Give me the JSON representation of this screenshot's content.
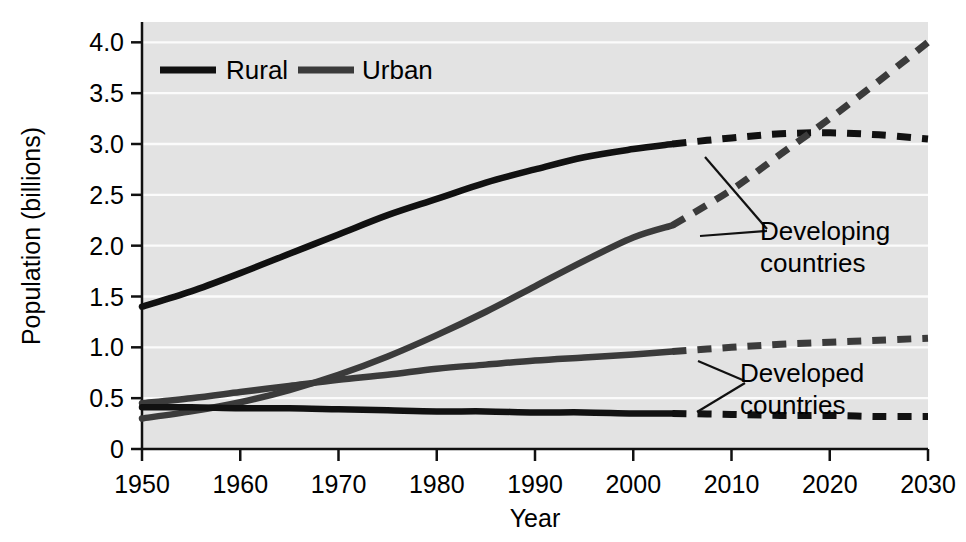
{
  "chart_data": {
    "type": "line",
    "title": "",
    "xlabel": "Year",
    "ylabel": "Population (billions)",
    "xlim": [
      1950,
      2030
    ],
    "ylim": [
      0,
      4.2
    ],
    "xticks": [
      1950,
      1960,
      1970,
      1980,
      1990,
      2000,
      2010,
      2020,
      2030
    ],
    "xtick_labels": [
      "1950",
      "1960",
      "1970",
      "1980",
      "1990",
      "2000",
      "2010",
      "2020",
      "2030"
    ],
    "yticks": [
      0,
      0.5,
      1.0,
      1.5,
      2.0,
      2.5,
      3.0,
      3.5,
      4.0
    ],
    "ytick_labels": [
      "0",
      "0.5",
      "1.0",
      "1.5",
      "2.0",
      "2.5",
      "3.0",
      "3.5",
      "4.0"
    ],
    "grid": "horizontal-white-gridlines",
    "legend_position": "top-left-inside",
    "plot_background": "#e3e3e3",
    "projection_split_year": 2004,
    "projection_style": "dashed",
    "legend": [
      {
        "name": "Rural",
        "color": "#111111"
      },
      {
        "name": "Urban",
        "color": "#3b3b3b"
      }
    ],
    "annotations": [
      {
        "text_line1": "Developing",
        "text_line2": "countries",
        "points_to": [
          "rural-developing",
          "urban-developing"
        ]
      },
      {
        "text_line1": "Developed",
        "text_line2": "countries",
        "points_to": [
          "urban-developed",
          "rural-developed"
        ]
      }
    ],
    "series": [
      {
        "name": "Rural developing",
        "group": "Developing countries",
        "type": "Rural",
        "color": "#111111",
        "x": [
          1950,
          1955,
          1960,
          1965,
          1970,
          1975,
          1980,
          1985,
          1990,
          1995,
          2000,
          2004,
          2010,
          2015,
          2020,
          2025,
          2030
        ],
        "values": [
          1.4,
          1.55,
          1.73,
          1.92,
          2.11,
          2.3,
          2.46,
          2.62,
          2.75,
          2.87,
          2.95,
          3.0,
          3.06,
          3.1,
          3.11,
          3.09,
          3.05
        ]
      },
      {
        "name": "Urban developing",
        "group": "Developing countries",
        "type": "Urban",
        "color": "#3b3b3b",
        "x": [
          1950,
          1955,
          1960,
          1965,
          1970,
          1975,
          1980,
          1985,
          1990,
          1995,
          2000,
          2004,
          2010,
          2015,
          2020,
          2025,
          2030
        ],
        "values": [
          0.3,
          0.37,
          0.46,
          0.58,
          0.73,
          0.91,
          1.12,
          1.35,
          1.6,
          1.85,
          2.08,
          2.2,
          2.55,
          2.9,
          3.25,
          3.62,
          4.0
        ]
      },
      {
        "name": "Urban developed",
        "group": "Developed countries",
        "type": "Urban",
        "color": "#3b3b3b",
        "x": [
          1950,
          1955,
          1960,
          1965,
          1970,
          1975,
          1980,
          1985,
          1990,
          1995,
          2000,
          2004,
          2010,
          2015,
          2020,
          2025,
          2030
        ],
        "values": [
          0.45,
          0.5,
          0.56,
          0.62,
          0.68,
          0.73,
          0.79,
          0.83,
          0.87,
          0.9,
          0.93,
          0.96,
          1.0,
          1.03,
          1.05,
          1.07,
          1.09
        ]
      },
      {
        "name": "Rural developed",
        "group": "Developed countries",
        "type": "Rural",
        "color": "#111111",
        "x": [
          1950,
          1955,
          1960,
          1965,
          1970,
          1975,
          1980,
          1985,
          1990,
          1995,
          2000,
          2004,
          2010,
          2015,
          2020,
          2025,
          2030
        ],
        "values": [
          0.41,
          0.41,
          0.4,
          0.4,
          0.39,
          0.38,
          0.37,
          0.37,
          0.36,
          0.36,
          0.35,
          0.35,
          0.34,
          0.33,
          0.33,
          0.32,
          0.32
        ]
      }
    ]
  }
}
